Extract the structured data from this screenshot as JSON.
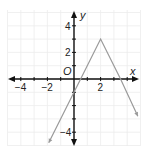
{
  "chart_data": {
    "type": "line",
    "title": "",
    "xlabel": "x",
    "ylabel": "y",
    "origin_label": "O",
    "xlim": [
      -5,
      5
    ],
    "ylim": [
      -5,
      5
    ],
    "grid": true,
    "x_ticks": [
      -4,
      -2,
      2
    ],
    "y_ticks": [
      4,
      2,
      -4
    ],
    "x_tick_labels": [
      "−4",
      "−2",
      "2"
    ],
    "y_tick_labels": [
      "4",
      "2",
      "−4"
    ],
    "series": [
      {
        "name": "piecewise linear (absolute-value shape, vertex at (2,3))",
        "x": [
          -1.9,
          0,
          0.5,
          2,
          3.5,
          4.8
        ],
        "y": [
          -4.8,
          -1,
          0,
          3,
          0,
          -2.8
        ],
        "color": "#999999",
        "arrows_at_ends": true
      }
    ],
    "annotations": [
      {
        "label": "vertex",
        "x": 2,
        "y": 3
      }
    ]
  },
  "colors": {
    "axis": "#111111",
    "grid": "#ececec",
    "line": "#9a9a9a"
  }
}
